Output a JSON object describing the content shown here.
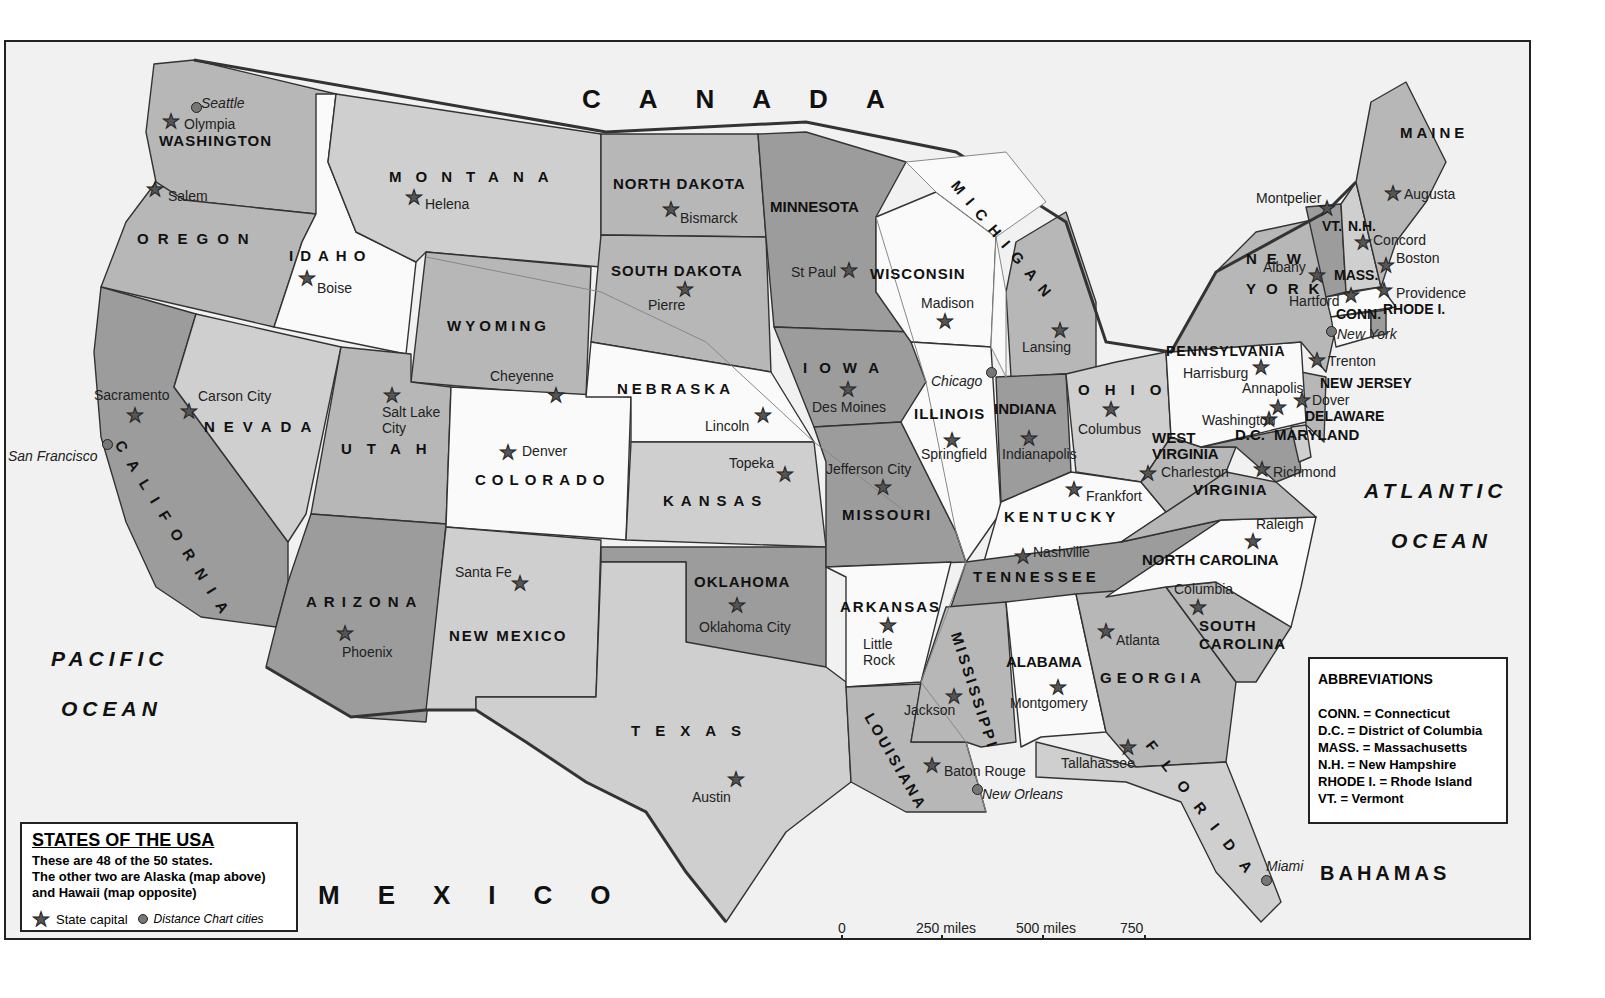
{
  "map": {
    "title": "STATES OF THE USA",
    "countries": {
      "canada": "CANADA",
      "mexico": "MEXICO",
      "bahamas": "BAHAMAS"
    },
    "oceans": {
      "pacific": [
        "PACIFIC",
        "OCEAN"
      ],
      "atlantic": [
        "ATLANTIC",
        "OCEAN"
      ]
    },
    "states": [
      {
        "name": "WASHINGTON",
        "capital": "Olympia"
      },
      {
        "name": "OREGON",
        "capital": "Salem"
      },
      {
        "name": "CALIFORNIA",
        "capital": "Sacramento"
      },
      {
        "name": "IDAHO",
        "capital": "Boise"
      },
      {
        "name": "NEVADA",
        "capital": "Carson City"
      },
      {
        "name": "MONTANA",
        "capital": "Helena"
      },
      {
        "name": "WYOMING",
        "capital": "Cheyenne"
      },
      {
        "name": "UTAH",
        "capital": "Salt Lake City"
      },
      {
        "name": "ARIZONA",
        "capital": "Phoenix"
      },
      {
        "name": "COLORADO",
        "capital": "Denver"
      },
      {
        "name": "NEW MEXICO",
        "capital": "Santa Fe"
      },
      {
        "name": "NORTH DAKOTA",
        "capital": "Bismarck"
      },
      {
        "name": "SOUTH DAKOTA",
        "capital": "Pierre"
      },
      {
        "name": "NEBRASKA",
        "capital": "Lincoln"
      },
      {
        "name": "KANSAS",
        "capital": "Topeka"
      },
      {
        "name": "OKLAHOMA",
        "capital": "Oklahoma City"
      },
      {
        "name": "TEXAS",
        "capital": "Austin"
      },
      {
        "name": "MINNESOTA",
        "capital": "St Paul"
      },
      {
        "name": "IOWA",
        "capital": "Des Moines"
      },
      {
        "name": "MISSOURI",
        "capital": "Jefferson City"
      },
      {
        "name": "ARKANSAS",
        "capital": "Little Rock"
      },
      {
        "name": "LOUISIANA",
        "capital": "Baton Rouge"
      },
      {
        "name": "WISCONSIN",
        "capital": "Madison"
      },
      {
        "name": "ILLINOIS",
        "capital": "Springfield"
      },
      {
        "name": "MICHIGAN",
        "capital": "Lansing"
      },
      {
        "name": "INDIANA",
        "capital": "Indianapolis"
      },
      {
        "name": "OHIO",
        "capital": "Columbus"
      },
      {
        "name": "KENTUCKY",
        "capital": "Frankfort"
      },
      {
        "name": "TENNESSEE",
        "capital": "Nashville"
      },
      {
        "name": "MISSISSIPPI",
        "capital": "Jackson"
      },
      {
        "name": "ALABAMA",
        "capital": "Montgomery"
      },
      {
        "name": "GEORGIA",
        "capital": "Atlanta"
      },
      {
        "name": "FLORIDA",
        "capital": "Tallahassee"
      },
      {
        "name": "SOUTH CAROLINA",
        "capital": "Columbia"
      },
      {
        "name": "NORTH CAROLINA",
        "capital": "Raleigh"
      },
      {
        "name": "VIRGINIA",
        "capital": "Richmond"
      },
      {
        "name": "WEST VIRGINIA",
        "capital": "Charleston"
      },
      {
        "name": "MARYLAND",
        "capital": "Annapolis"
      },
      {
        "name": "DELAWARE",
        "capital": "Dover"
      },
      {
        "name": "NEW JERSEY",
        "capital": "Trenton"
      },
      {
        "name": "PENNSYLVANIA",
        "capital": "Harrisburg"
      },
      {
        "name": "NEW YORK",
        "capital": "Albany"
      },
      {
        "name": "CONN.",
        "capital": "Hartford"
      },
      {
        "name": "RHODE I.",
        "capital": "Providence"
      },
      {
        "name": "MASS.",
        "capital": "Boston"
      },
      {
        "name": "VT.",
        "capital": "Montpelier"
      },
      {
        "name": "N.H.",
        "capital": "Concord"
      },
      {
        "name": "MAINE",
        "capital": "Augusta"
      },
      {
        "name": "D.C.",
        "capital": "Washington"
      }
    ],
    "distance_cities": [
      "Seattle",
      "San Francisco",
      "Chicago",
      "New York",
      "New Orleans",
      "Miami"
    ]
  },
  "legend": {
    "title": "STATES OF THE USA",
    "desc1": "These are 48 of the 50 states.",
    "desc2": "The other two are Alaska (map above)",
    "desc3": "and Hawaii (map opposite)",
    "capital_key": "State capital",
    "city_key": "Distance Chart cities"
  },
  "abbreviations": {
    "title": "ABBREVIATIONS",
    "items": [
      "CONN. = Connecticut",
      "D.C. = District of Columbia",
      "MASS. = Massachusetts",
      "N.H. = New Hampshire",
      "RHODE I. = Rhode Island",
      "VT. = Vermont"
    ]
  },
  "scale": {
    "labels": [
      "0",
      "250 miles",
      "500 miles",
      "750 miles"
    ]
  },
  "copyright": "COPYRIGHT PHILIP'S"
}
